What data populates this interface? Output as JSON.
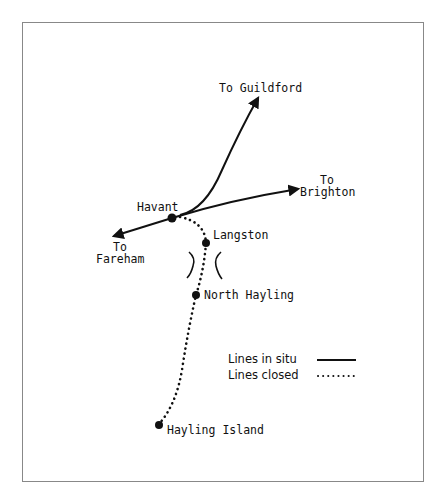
{
  "diagram": {
    "type": "railway-route-map",
    "stations": [
      {
        "id": "havant",
        "label": "Havant"
      },
      {
        "id": "langston",
        "label": "Langston"
      },
      {
        "id": "north_hayling",
        "label": "North Hayling"
      },
      {
        "id": "hayling_island",
        "label": "Hayling Island"
      }
    ],
    "destinations": {
      "guildford": {
        "line1": "To Guildford"
      },
      "brighton": {
        "line1": "To",
        "line2": "Brighton"
      },
      "fareham": {
        "line1": "To",
        "line2": "Fareham"
      }
    },
    "legend": {
      "in_situ": {
        "label": "Lines in situ",
        "style": "solid"
      },
      "closed": {
        "label": "Lines closed",
        "style": "dotted"
      }
    },
    "colors": {
      "ink": "#111111",
      "frame": "#888888",
      "background": "#ffffff"
    }
  }
}
